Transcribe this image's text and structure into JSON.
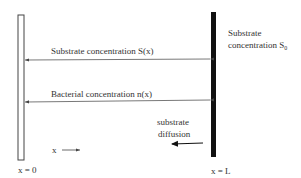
{
  "diagram": {
    "labels": {
      "substrate_concentration_sx": "Substrate concentration S(x)",
      "bacterial_concentration_nx": "Bacterial concentration n(x)",
      "right_label_line1": "Substrate",
      "right_label_line2": "concentration S",
      "right_label_sub": "0",
      "diffusion_line1": "substrate",
      "diffusion_line2": "diffusion",
      "x_axis": "x",
      "left_boundary": "x = 0",
      "right_boundary": "x = L"
    }
  }
}
